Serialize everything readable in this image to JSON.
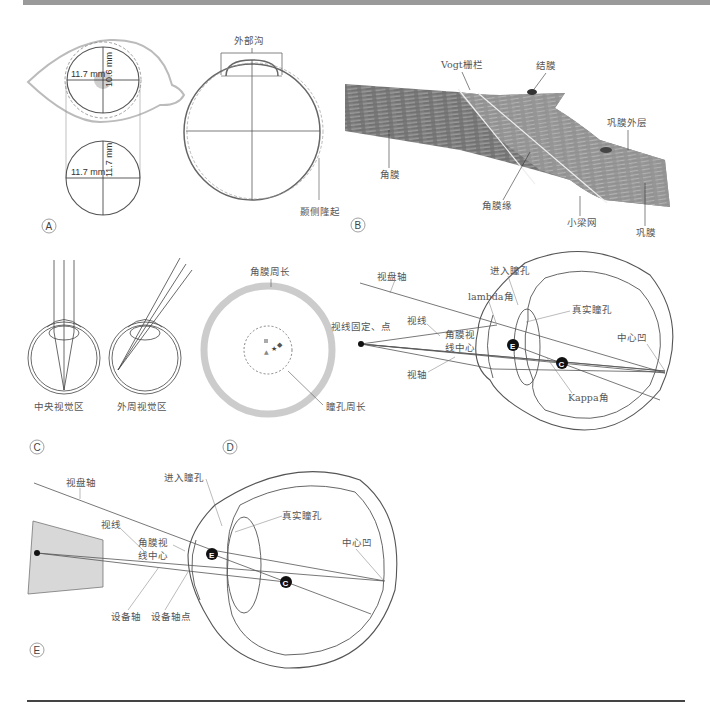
{
  "panels": {
    "A": {
      "badge": "A",
      "eye_horizontal_mm": "11.7 mm",
      "eye_vertical_mm": "10.6 mm",
      "circle_horizontal_mm": "11.7 mm",
      "circle_vertical_mm": "11.7 mm",
      "sulcus_label": "外部沟",
      "temporal_label": "颞侧隆起"
    },
    "B": {
      "badge": "B",
      "labels": {
        "vogt": "Vogt栅栏",
        "conjunctiva": "结膜",
        "outer_sclera": "巩膜外层",
        "cornea": "角膜",
        "limbus": "角膜缘",
        "trabecular": "小梁网",
        "sclera": "巩膜"
      }
    },
    "C": {
      "badge": "C",
      "central": "中央视觉区",
      "peripheral": "外周视觉区"
    },
    "D": {
      "badge": "D",
      "cornea_perimeter": "角膜周长",
      "pupil_perimeter": "瞳孔周长"
    },
    "D2": {
      "optic_axis": "视盘轴",
      "fixation_point": "视线固定、点",
      "line_of_sight": "视线",
      "corneal_center": "角膜视线中心",
      "corneal_center_l1": "角膜视",
      "corneal_center_l2": "线中心",
      "visual_axis": "视轴",
      "entrance_pupil": "进入瞳孔",
      "lambda": "lambda角",
      "true_pupil": "真实瞳孔",
      "fovea": "中心凹",
      "kappa": "Kappa角",
      "marker_e": "E",
      "marker_c": "C"
    },
    "E": {
      "badge": "E",
      "optic_axis": "视盘轴",
      "entrance_pupil": "进入瞳孔",
      "true_pupil": "真实瞳孔",
      "line_of_sight": "视线",
      "corneal_center_l1": "角膜视",
      "corneal_center_l2": "线中心",
      "fovea": "中心凹",
      "device_axis": "设备轴",
      "device_axis_point": "设备轴点",
      "marker_e": "E",
      "marker_c": "C"
    }
  },
  "colors": {
    "line": "#555555",
    "eye_fill": "#d8d8d8",
    "pupil_spot": "#c8c8c8",
    "histology_dark": "#6a6a6a",
    "histology_light": "#a8a8a8",
    "marker": "#111111"
  }
}
